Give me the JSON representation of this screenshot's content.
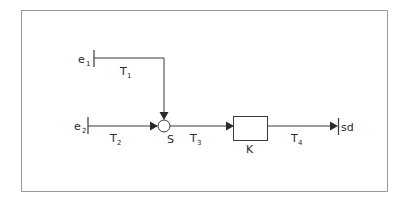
{
  "diagram": {
    "type": "signal-flow / block diagram",
    "nodes": {
      "e1": {
        "label": "e",
        "sub": "1",
        "kind": "input"
      },
      "e2": {
        "label": "e",
        "sub": "2",
        "kind": "input"
      },
      "S": {
        "label": "S",
        "kind": "summing-junction"
      },
      "K": {
        "label": "K",
        "kind": "block"
      },
      "sd": {
        "label": "sd",
        "kind": "output"
      }
    },
    "edges": [
      {
        "id": "T1",
        "label": "T",
        "sub": "1",
        "from": "e1",
        "to": "S"
      },
      {
        "id": "T2",
        "label": "T",
        "sub": "2",
        "from": "e2",
        "to": "S"
      },
      {
        "id": "T3",
        "label": "T",
        "sub": "3",
        "from": "S",
        "to": "K"
      },
      {
        "id": "T4",
        "label": "T",
        "sub": "4",
        "from": "K",
        "to": "sd"
      }
    ]
  },
  "colors": {
    "stroke": "#3a3a3a",
    "frame": "#9a9a9a",
    "background": "#ffffff"
  }
}
